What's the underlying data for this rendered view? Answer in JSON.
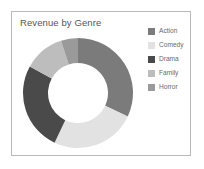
{
  "card": {
    "title": "Revenue by Genre",
    "background": "#ffffff",
    "border_color": "#b9b9b9"
  },
  "legend": {
    "position": "right",
    "items": [
      {
        "label": "Action",
        "color": "#7b7b7b"
      },
      {
        "label": "Comedy",
        "color": "#e2e2e2"
      },
      {
        "label": "Drama",
        "color": "#4a4a4a"
      },
      {
        "label": "Family",
        "color": "#bdbdbd"
      },
      {
        "label": "Horror",
        "color": "#9a9a9a"
      }
    ]
  },
  "chart_data": {
    "type": "pie",
    "variant": "donut",
    "title": "Revenue by Genre",
    "xlabel": "",
    "ylabel": "",
    "categories": [
      "Action",
      "Comedy",
      "Drama",
      "Family",
      "Horror"
    ],
    "values": [
      32,
      25,
      26,
      12,
      5
    ],
    "unit": "percent",
    "colors": [
      "#7b7b7b",
      "#e2e2e2",
      "#4a4a4a",
      "#bdbdbd",
      "#9a9a9a"
    ],
    "start_angle_deg": 0,
    "direction": "clockwise",
    "inner_radius_ratio": 0.55,
    "legend_position": "right",
    "grid": false,
    "data_labels": false
  },
  "geometry": {
    "cx": 62,
    "cy": 60,
    "outer_r": 55,
    "inner_r": 30
  }
}
